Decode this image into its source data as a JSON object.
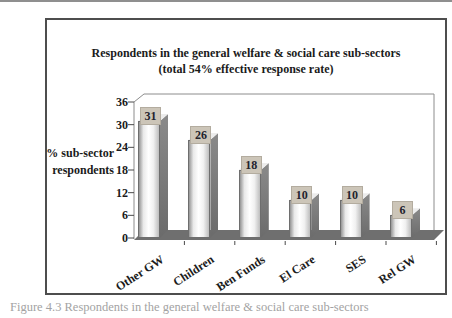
{
  "figure": {
    "title_line1": "Respondents in the general welfare & social care sub-sectors",
    "title_line2": "(total 54% effective response rate)",
    "y_axis_label_line1": "% sub-sector",
    "y_axis_label_line2": "respondents",
    "caption": "Figure 4.3 Respondents in the general welfare & social care sub-sectors"
  },
  "chart_data": {
    "type": "bar",
    "style": "3d-column",
    "title": "Respondents in the general welfare & social care sub-sectors (total 54% effective response rate)",
    "categories": [
      "Other GW",
      "Children",
      "Ben Funds",
      "El Care",
      "SES",
      "Rel GW"
    ],
    "values": [
      31,
      26,
      18,
      10,
      10,
      6
    ],
    "data_labels": [
      "31",
      "26",
      "18",
      "10",
      "10",
      "6"
    ],
    "xlabel": "",
    "ylabel": "% sub-sector respondents",
    "yticks": [
      0,
      6,
      12,
      18,
      24,
      30,
      36
    ],
    "ylim": [
      0,
      36
    ],
    "grid": "off",
    "legend": "none"
  },
  "colors": {
    "frame_border": "#4d4d4d",
    "axis_line": "#8c8c8c",
    "tick_mark": "#4a4a4a",
    "floor": "#6f6f6f",
    "bar_side_light": "#8a8a8a",
    "bar_side_dark": "#6b6b6b",
    "bar_top": "#ececec",
    "label_box_bg": "#ccc5b8",
    "label_text": "#23232e",
    "caption_text": "#a3a3a3"
  }
}
